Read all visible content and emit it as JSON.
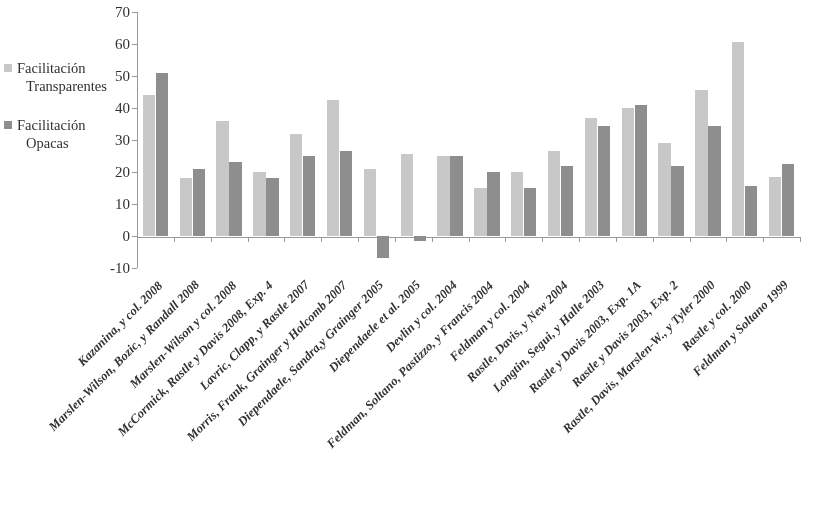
{
  "legend": {
    "position": "left",
    "entries": [
      {
        "name": "legend-transparentes",
        "label_line1": "Facilitación",
        "label_line2": "Transparentes",
        "color": "#c9c9c9"
      },
      {
        "name": "legend-opacas",
        "label_line1": "Facilitación",
        "label_line2": "Opacas",
        "color": "#8d8d8d"
      }
    ]
  },
  "axis": {
    "y_ticks": [
      "70",
      "60",
      "50",
      "40",
      "30",
      "20",
      "10",
      "0",
      "-10"
    ]
  },
  "chart_data": {
    "type": "bar",
    "title": "",
    "subtitle": "",
    "xlabel": "",
    "ylabel": "",
    "ylim": [
      -10,
      70
    ],
    "ytick_values": [
      70,
      60,
      50,
      40,
      30,
      20,
      10,
      0,
      -10
    ],
    "grid": false,
    "legend_position": "left",
    "colors": {
      "transparentes": "#c9c9c9",
      "opacas": "#8d8d8d"
    },
    "categories": [
      "Kazanina, y col. 2008",
      "Marslen-Wilson, Bozic, y Randall 2008",
      "Marslen-Wilson y col. 2008",
      "McCormick, Rastle y Davis 2008, Exp. 4",
      "Lavric, Clapp, y Rastle 2007",
      "Morris, Frank, Grainger y Holcomb 2007",
      "Diependaele, Sandra,y Grainger 2005",
      "Diependaele et al. 2005",
      "Devlin y col. 2004",
      "Feldman, Soltano, Pastizzo, y Francis 2004",
      "Feldman y col. 2004",
      "Rastle, Davis, y New 2004",
      "Longtin, Segui, y Halle 2003",
      "Rastle y Davis 2003, Exp. 1A",
      "Rastle y Davis 2003, Exp. 2",
      "Rastle, Davis, Marslen-W., y Tyler 2000",
      "Rastle y col. 2000",
      "Feldman y Soltano 1999"
    ],
    "series": [
      {
        "name": "Facilitación Transparentes",
        "color": "#c9c9c9",
        "values": [
          44,
          18,
          36,
          20,
          32,
          42.5,
          21,
          25.5,
          25,
          15,
          20,
          26.5,
          37,
          40,
          29,
          45.5,
          60.5,
          18.5
        ]
      },
      {
        "name": "Facilitación Opacas",
        "color": "#8d8d8d",
        "values": [
          51,
          21,
          23,
          18,
          25,
          26.5,
          -7,
          -1.5,
          25,
          20,
          15,
          22,
          34.5,
          41,
          22,
          34.5,
          15.5,
          22.5
        ]
      }
    ]
  }
}
